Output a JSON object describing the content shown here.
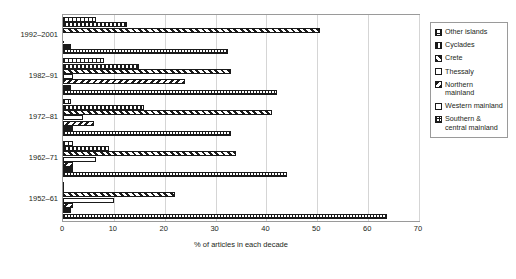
{
  "chart_data": {
    "type": "bar",
    "orientation": "horizontal-grouped",
    "title": "",
    "xlabel": "% of articles in each decade",
    "ylabel": "",
    "xlim": [
      0,
      70
    ],
    "xticks": [
      0,
      10,
      20,
      30,
      40,
      50,
      60,
      70
    ],
    "grid": "vertical",
    "legend_position": "right",
    "categories": [
      "1992–2001",
      "1982–91",
      "1972–81",
      "1962–71",
      "1952–61"
    ],
    "series": [
      {
        "name": "Other islands",
        "pattern": "pat-other",
        "values": [
          6.5,
          8.0,
          1.5,
          2.0,
          0.0
        ]
      },
      {
        "name": "Cyclades",
        "pattern": "pat-cyclades",
        "values": [
          12.5,
          15.0,
          16.0,
          9.0,
          0.0
        ]
      },
      {
        "name": "Crete",
        "pattern": "pat-crete",
        "values": [
          50.5,
          33.0,
          41.0,
          34.0,
          22.0
        ]
      },
      {
        "name": "Thessaly",
        "pattern": "pat-thessaly",
        "values": [
          0.0,
          2.0,
          4.0,
          6.5,
          10.0
        ]
      },
      {
        "name": "Northern mainland",
        "pattern": "pat-northern",
        "values": [
          0.0,
          24.0,
          6.0,
          2.0,
          2.0
        ]
      },
      {
        "name": "Western mainland",
        "pattern": "pat-western",
        "values": [
          1.5,
          1.5,
          2.0,
          2.0,
          1.5
        ]
      },
      {
        "name": "Southern & central mainland",
        "pattern": "pat-southern",
        "values": [
          32.5,
          42.0,
          33.0,
          44.0,
          63.8
        ]
      }
    ]
  },
  "legend": {
    "items": [
      {
        "label": "Other islands",
        "pattern": "pat-other"
      },
      {
        "label": "Cyclades",
        "pattern": "pat-cyclades"
      },
      {
        "label": "Crete",
        "pattern": "pat-crete"
      },
      {
        "label": "Thessaly",
        "pattern": "pat-thessaly"
      },
      {
        "label": "Northern mainland",
        "pattern": "pat-northern"
      },
      {
        "label": "Western mainland",
        "pattern": "pat-western"
      },
      {
        "label": "Southern & central mainland",
        "pattern": "pat-southern"
      }
    ]
  },
  "colors": {
    "ink": "#1a1a1a",
    "text": "#231f20",
    "frame": "#9a9a9a",
    "grid": "#d5d5d5",
    "background": "#ffffff"
  }
}
